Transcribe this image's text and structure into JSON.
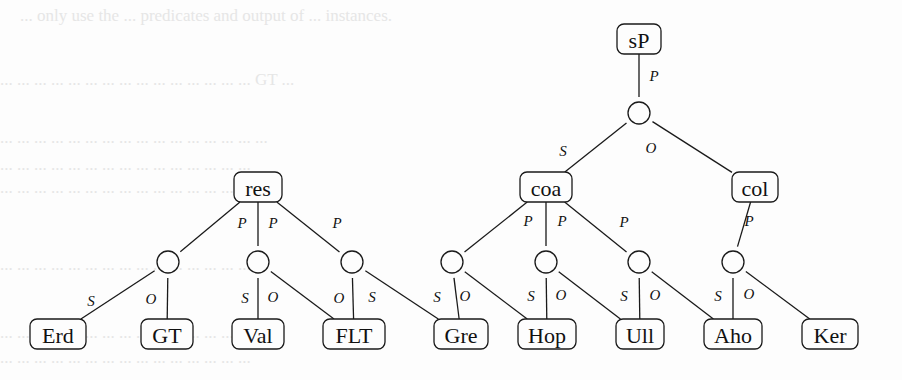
{
  "diagram": {
    "type": "tree-graph",
    "background_text_lines": [
      "... only use the ... predicates and output of ... instances.",
      "... ... ... ... ... ... ... ... ... ... ... ... ... ... ... GT ...",
      "... ... ... ... ... ... ... ... ... ... ... ... ... ... ... ...",
      "... ... ... ... ... ... ... ... ... ... ... ... ... ... ...",
      "... ... ... ... ... ... ... ... ... ... ... ... ... ...",
      "... ... ... ... ... ... ... ... ... ... ... ... ... ... ...",
      "... ... ... ... ... ... ... ... ... ... ... ... ... ... ...",
      "... ... ... ... ... ... ... ... ... ... ... ... ... ... ..."
    ],
    "nodes": {
      "sP": {
        "label": "sP",
        "x": 639,
        "y": 39,
        "w": 44
      },
      "coa": {
        "label": "coa",
        "x": 546,
        "y": 187,
        "w": 52
      },
      "col": {
        "label": "col",
        "x": 755,
        "y": 187,
        "w": 46
      },
      "res": {
        "label": "res",
        "x": 258,
        "y": 187,
        "w": 48
      },
      "Erd": {
        "label": "Erd",
        "x": 58,
        "y": 334,
        "w": 56
      },
      "GT": {
        "label": "GT",
        "x": 167,
        "y": 334,
        "w": 52
      },
      "Val": {
        "label": "Val",
        "x": 258,
        "y": 334,
        "w": 52
      },
      "FLT": {
        "label": "FLT",
        "x": 354,
        "y": 334,
        "w": 62
      },
      "Gre": {
        "label": "Gre",
        "x": 461,
        "y": 334,
        "w": 54
      },
      "Hop": {
        "label": "Hop",
        "x": 547,
        "y": 334,
        "w": 58
      },
      "Ull": {
        "label": "Ull",
        "x": 640,
        "y": 334,
        "w": 48
      },
      "Aho": {
        "label": "Aho",
        "x": 733,
        "y": 334,
        "w": 58
      },
      "Ker": {
        "label": "Ker",
        "x": 830,
        "y": 334,
        "w": 56
      }
    },
    "circles": {
      "c0": {
        "x": 639,
        "y": 113
      },
      "c1": {
        "x": 168,
        "y": 262
      },
      "c2": {
        "x": 258,
        "y": 262
      },
      "c3": {
        "x": 352,
        "y": 262
      },
      "c4": {
        "x": 452,
        "y": 262
      },
      "c5": {
        "x": 546,
        "y": 262
      },
      "c6": {
        "x": 639,
        "y": 262
      },
      "c7": {
        "x": 733,
        "y": 262
      }
    },
    "edges": [
      {
        "from": "sP",
        "to": "c0",
        "label": "P"
      },
      {
        "from": "c0",
        "to": "coa",
        "label": "S"
      },
      {
        "from": "c0",
        "to": "col",
        "label": "O"
      },
      {
        "from": "res",
        "to": "c1",
        "label": "P"
      },
      {
        "from": "res",
        "to": "c2",
        "label": "P"
      },
      {
        "from": "res",
        "to": "c3",
        "label": "P"
      },
      {
        "from": "coa",
        "to": "c4",
        "label": "P"
      },
      {
        "from": "coa",
        "to": "c5",
        "label": "P"
      },
      {
        "from": "coa",
        "to": "c6",
        "label": "P"
      },
      {
        "from": "col",
        "to": "c7",
        "label": "P"
      },
      {
        "from": "c1",
        "to": "Erd",
        "label": "S"
      },
      {
        "from": "c1",
        "to": "GT",
        "label": "O"
      },
      {
        "from": "c2",
        "to": "Val",
        "label": "S"
      },
      {
        "from": "c2",
        "to": "FLT",
        "label": "O"
      },
      {
        "from": "c3",
        "to": "FLT",
        "label": "O"
      },
      {
        "from": "c3",
        "to": "Gre",
        "label": "S"
      },
      {
        "from": "c4",
        "to": "Gre",
        "label": "S"
      },
      {
        "from": "c4",
        "to": "Hop",
        "label": "O"
      },
      {
        "from": "c5",
        "to": "Hop",
        "label": "S"
      },
      {
        "from": "c5",
        "to": "Ull",
        "label": "O"
      },
      {
        "from": "c6",
        "to": "Ull",
        "label": "S"
      },
      {
        "from": "c6",
        "to": "Aho",
        "label": "O"
      },
      {
        "from": "c7",
        "to": "Aho",
        "label": "S"
      },
      {
        "from": "c7",
        "to": "Ker",
        "label": "O"
      }
    ],
    "edge_labels": [
      {
        "text": "P",
        "x": 654,
        "y": 76
      },
      {
        "text": "S",
        "x": 563,
        "y": 151
      },
      {
        "text": "O",
        "x": 651,
        "y": 148
      },
      {
        "text": "P",
        "x": 242,
        "y": 223
      },
      {
        "text": "P",
        "x": 273,
        "y": 223
      },
      {
        "text": "P",
        "x": 337,
        "y": 223
      },
      {
        "text": "P",
        "x": 528,
        "y": 221
      },
      {
        "text": "P",
        "x": 562,
        "y": 221
      },
      {
        "text": "P",
        "x": 624,
        "y": 222
      },
      {
        "text": "P",
        "x": 749,
        "y": 221
      },
      {
        "text": "S",
        "x": 91,
        "y": 301
      },
      {
        "text": "O",
        "x": 151,
        "y": 299
      },
      {
        "text": "S",
        "x": 245,
        "y": 298
      },
      {
        "text": "O",
        "x": 273,
        "y": 297
      },
      {
        "text": "O",
        "x": 339,
        "y": 298
      },
      {
        "text": "S",
        "x": 372,
        "y": 297
      },
      {
        "text": "S",
        "x": 437,
        "y": 297
      },
      {
        "text": "O",
        "x": 465,
        "y": 296
      },
      {
        "text": "S",
        "x": 531,
        "y": 296
      },
      {
        "text": "O",
        "x": 561,
        "y": 295
      },
      {
        "text": "S",
        "x": 624,
        "y": 296
      },
      {
        "text": "O",
        "x": 655,
        "y": 295
      },
      {
        "text": "S",
        "x": 718,
        "y": 296
      },
      {
        "text": "O",
        "x": 749,
        "y": 294
      }
    ]
  }
}
